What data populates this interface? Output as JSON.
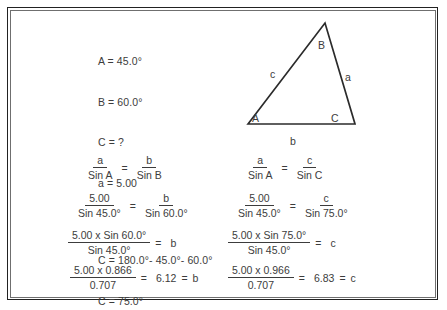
{
  "givens": {
    "angle_A": "A = 45.0°",
    "angle_B": "B = 60.0°",
    "angle_C_unknown": "C = ?",
    "side_a": "a = 5.00",
    "angle_C_expression": "C = 180.0°- 45.0°- 60.0°",
    "angle_C_result": "C = 75.0°"
  },
  "triangle": {
    "vertex_A_label": "A",
    "vertex_B_label": "B",
    "vertex_C_label": "C",
    "side_a_label": "a",
    "side_b_label": "b",
    "side_c_label": "c",
    "stroke_color": "#2b2b2b"
  },
  "equations": {
    "left": {
      "row1": {
        "frac1_num": "a",
        "frac1_den": "Sin A",
        "equals": "=",
        "frac2_num": "b",
        "frac2_den": "Sin B"
      },
      "row2": {
        "frac1_num": "5.00",
        "frac1_den": "Sin 45.0°",
        "equals": "=",
        "frac2_num": "b",
        "frac2_den": "Sin 60.0°"
      },
      "row3": {
        "frac_num": "5.00 x Sin 60.0°",
        "frac_den": "Sin 45.0°",
        "equals": "=",
        "result": "b"
      },
      "row4": {
        "frac_num": "5.00 x 0.866",
        "frac_den": "0.707",
        "equals": "=",
        "value": "6.12",
        "equals2": "=",
        "result": "b"
      }
    },
    "right": {
      "row1": {
        "frac1_num": "a",
        "frac1_den": "Sin A",
        "equals": "=",
        "frac2_num": "c",
        "frac2_den": "Sin C"
      },
      "row2": {
        "frac1_num": "5.00",
        "frac1_den": "Sin 45.0°",
        "equals": "=",
        "frac2_num": "c",
        "frac2_den": "Sin 75.0°"
      },
      "row3": {
        "frac_num": "5.00 x Sin 75.0°",
        "frac_den": "Sin 45.0°",
        "equals": "=",
        "result": "c"
      },
      "row4": {
        "frac_num": "5.00 x 0.966",
        "frac_den": "0.707",
        "equals": "=",
        "value": "6.83",
        "equals2": "=",
        "result": "c"
      }
    }
  }
}
